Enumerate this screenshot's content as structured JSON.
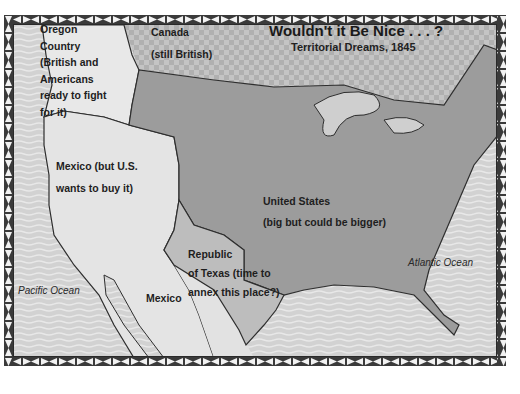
{
  "map": {
    "title": "Wouldn't it Be Nice . . . ?",
    "subtitle": "Territorial Dreams, 1845",
    "regions": [
      {
        "id": "oregon",
        "lines": [
          "Oregon",
          "Country",
          "(British and",
          "Americans",
          "ready to fight",
          "for it)"
        ]
      },
      {
        "id": "canada",
        "lines": [
          "Canada",
          "(still British)"
        ]
      },
      {
        "id": "mexico-north",
        "lines": [
          "Mexico (but U.S.",
          "wants to buy it)"
        ]
      },
      {
        "id": "united-states",
        "lines": [
          "United States",
          "(big but could be bigger)"
        ]
      },
      {
        "id": "texas",
        "lines": [
          "Republic",
          "of Texas (time to",
          "annex this place?)"
        ]
      },
      {
        "id": "mexico",
        "lines": [
          "Mexico"
        ]
      }
    ],
    "oceans": {
      "pacific": "Pacific Ocean",
      "atlantic": "Atlantic Ocean"
    },
    "colors": {
      "ocean": "#d4d4d4",
      "us": "#9a9a9a",
      "canada": "#b8b8b8",
      "oregon": "#e6e6e6",
      "mexico": "#e2e2e2",
      "texas": "#bdbdbd",
      "border": "#333333"
    }
  }
}
